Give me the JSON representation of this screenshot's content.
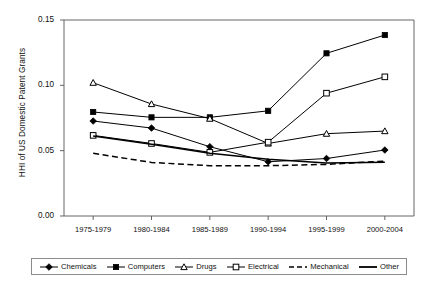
{
  "chart_data": {
    "type": "line",
    "title": "",
    "xlabel": "",
    "ylabel": "HHI of US Domestic Patent Grants",
    "categories": [
      "1975-1979",
      "1980-1984",
      "1985-1989",
      "1990-1994",
      "1995-1999",
      "2000-2004"
    ],
    "ylim": [
      0.0,
      0.15
    ],
    "yticks": [
      "0.00",
      "0.05",
      "0.10",
      "0.15"
    ],
    "ytick_values": [
      0.0,
      0.05,
      0.1,
      0.15
    ],
    "grid": false,
    "legend_position": "bottom",
    "series": [
      {
        "name": "Chemicals",
        "marker": "filled-diamond",
        "line": "solid",
        "color": "#000000",
        "values": [
          0.0727,
          0.0673,
          0.053,
          0.0415,
          0.044,
          0.0505
        ]
      },
      {
        "name": "Computers",
        "marker": "filled-square",
        "line": "solid",
        "color": "#000000",
        "values": [
          0.0796,
          0.0755,
          0.0755,
          0.0805,
          0.1245,
          0.1385
        ]
      },
      {
        "name": "Drugs",
        "marker": "open-triangle",
        "line": "solid",
        "color": "#000000",
        "values": [
          0.102,
          0.0857,
          0.0745,
          0.0555,
          0.063,
          0.065
        ]
      },
      {
        "name": "Electrical",
        "marker": "open-square",
        "line": "solid",
        "color": "#000000",
        "values": [
          0.0617,
          0.0555,
          0.0487,
          0.0565,
          0.094,
          0.1065
        ]
      },
      {
        "name": "Mechanical",
        "marker": "none",
        "line": "dashed",
        "color": "#000000",
        "values": [
          0.048,
          0.041,
          0.0385,
          0.0385,
          0.0395,
          0.042
        ]
      },
      {
        "name": "Other",
        "marker": "none",
        "line": "solid",
        "color": "#000000",
        "values": [
          0.0612,
          0.055,
          0.048,
          0.0435,
          0.0405,
          0.0412
        ]
      }
    ]
  },
  "legend": {
    "items": [
      {
        "label": "Chemicals"
      },
      {
        "label": "Computers"
      },
      {
        "label": "Drugs"
      },
      {
        "label": "Electrical"
      },
      {
        "label": "Mechanical"
      },
      {
        "label": "Other"
      }
    ]
  }
}
